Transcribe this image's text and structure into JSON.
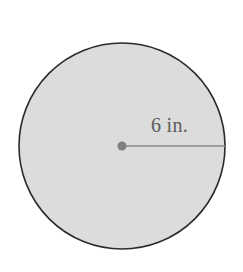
{
  "figure": {
    "background_color": "#ffffff",
    "canvas": {
      "width": 243,
      "height": 272
    },
    "circle": {
      "center_x": 122,
      "center_y": 146,
      "radius_px": 103,
      "fill_color": "#dcdcdc",
      "stroke_color": "#2b2b2b",
      "stroke_width": 1.6
    },
    "center_dot": {
      "center_x": 122,
      "center_y": 146,
      "radius_px": 4.5,
      "color": "#808080"
    },
    "radius_segment": {
      "x1": 122,
      "y1": 146,
      "x2": 225,
      "y2": 146,
      "color": "#8a8a8a",
      "stroke_width": 1.6
    },
    "radius_label": {
      "text": "6 in.",
      "value": 6,
      "unit": "in.",
      "color": "#5b5b5b",
      "x": 151,
      "y": 114
    }
  },
  "chart_data": {
    "type": "diagram",
    "title": "",
    "shape": "circle",
    "measurements": [
      {
        "name": "radius",
        "label": "6 in.",
        "value": 6,
        "unit": "in."
      }
    ],
    "annotations": [
      "6 in."
    ],
    "legend": [],
    "grid": false
  }
}
